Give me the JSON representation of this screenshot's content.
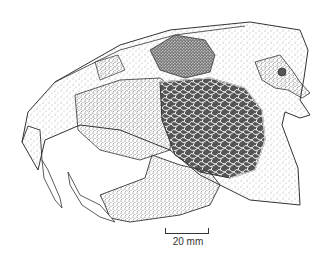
{
  "figure": {
    "scale_bar": {
      "label": "20 mm",
      "length_px": 44
    },
    "colors": {
      "background": "#ffffff",
      "ink": "#333333",
      "stipple_dark": "#222222"
    }
  }
}
